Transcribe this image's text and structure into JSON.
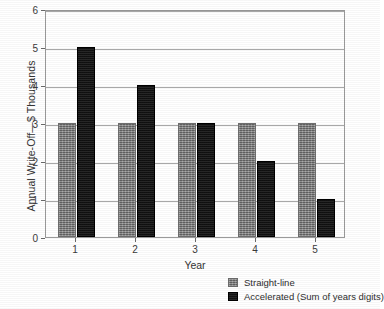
{
  "chart_data": {
    "type": "bar",
    "title": "",
    "xlabel": "Year",
    "ylabel": "Annual Write-Off—$ Thousands",
    "categories": [
      "1",
      "2",
      "3",
      "4",
      "5"
    ],
    "series": [
      {
        "name": "Straight-line",
        "color": "#848484",
        "values": [
          3,
          3,
          3,
          3,
          3
        ]
      },
      {
        "name": "Accelerated (Sum of years digits)",
        "color": "#161616",
        "values": [
          5,
          4,
          3,
          2,
          1
        ]
      }
    ],
    "ylim": [
      0,
      6
    ],
    "ytick_labels": [
      "0",
      "1",
      "2",
      "3",
      "4",
      "5",
      "6"
    ],
    "ytick_values": [
      0,
      1,
      2,
      3,
      4,
      5,
      6
    ],
    "grid": true,
    "grid_axis": "y",
    "legend_position": "bottom-right"
  }
}
